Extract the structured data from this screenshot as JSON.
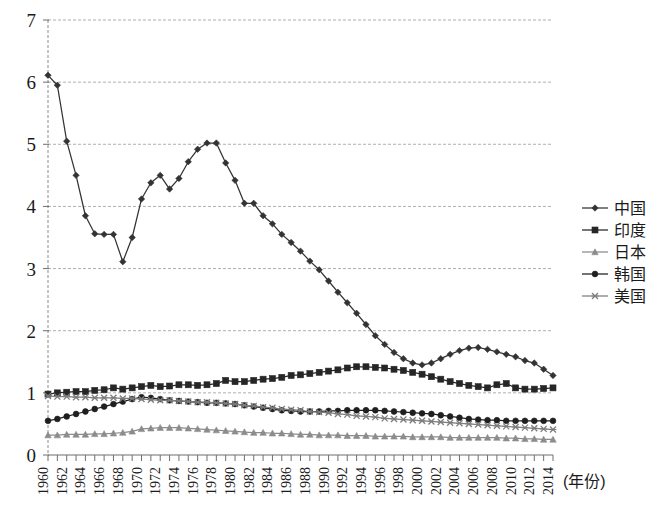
{
  "chart_data": {
    "type": "line",
    "title": "",
    "subtitle": "",
    "xlabel": "(年份)",
    "ylabel": "",
    "xlim": [
      1960,
      2014
    ],
    "ylim": [
      0,
      7
    ],
    "ytick_labels": [
      "0",
      "1",
      "2",
      "3",
      "4",
      "5",
      "6",
      "7"
    ],
    "ytick_values": [
      0,
      1,
      2,
      3,
      4,
      5,
      6,
      7
    ],
    "grid": "horizontal-dashed",
    "legend_position": "right",
    "x": [
      1960,
      1961,
      1962,
      1963,
      1964,
      1965,
      1966,
      1967,
      1968,
      1969,
      1970,
      1971,
      1972,
      1973,
      1974,
      1975,
      1976,
      1977,
      1978,
      1979,
      1980,
      1981,
      1982,
      1983,
      1984,
      1985,
      1986,
      1987,
      1988,
      1989,
      1990,
      1991,
      1992,
      1993,
      1994,
      1995,
      1996,
      1997,
      1998,
      1999,
      2000,
      2001,
      2002,
      2003,
      2004,
      2005,
      2006,
      2007,
      2008,
      2009,
      2010,
      2011,
      2012,
      2013,
      2014
    ],
    "xtick_labels": [
      "1960",
      "1962",
      "1964",
      "1966",
      "1968",
      "1970",
      "1972",
      "1974",
      "1976",
      "1978",
      "1980",
      "1982",
      "1984",
      "1986",
      "1988",
      "1990",
      "1992",
      "1994",
      "1996",
      "1998",
      "2000",
      "2002",
      "2004",
      "2006",
      "2008",
      "2010",
      "2012",
      "2014"
    ],
    "series": [
      {
        "name": "中国",
        "marker": "diamond",
        "color": "#333333",
        "values": [
          6.11,
          5.95,
          5.05,
          4.5,
          3.85,
          3.56,
          3.55,
          3.55,
          3.11,
          3.5,
          4.12,
          4.38,
          4.5,
          4.28,
          4.45,
          4.72,
          4.92,
          5.02,
          5.02,
          4.7,
          4.42,
          4.05,
          4.05,
          3.85,
          3.72,
          3.55,
          3.42,
          3.28,
          3.12,
          2.98,
          2.8,
          2.62,
          2.45,
          2.28,
          2.1,
          1.92,
          1.78,
          1.65,
          1.55,
          1.48,
          1.45,
          1.48,
          1.55,
          1.62,
          1.68,
          1.72,
          1.73,
          1.7,
          1.66,
          1.62,
          1.58,
          1.52,
          1.48,
          1.38,
          1.28
        ]
      },
      {
        "name": "印度",
        "marker": "square",
        "color": "#262626",
        "values": [
          0.98,
          1.0,
          1.01,
          1.02,
          1.02,
          1.04,
          1.05,
          1.08,
          1.06,
          1.08,
          1.1,
          1.12,
          1.1,
          1.11,
          1.13,
          1.13,
          1.12,
          1.13,
          1.15,
          1.2,
          1.18,
          1.18,
          1.2,
          1.22,
          1.23,
          1.25,
          1.28,
          1.29,
          1.31,
          1.33,
          1.35,
          1.37,
          1.4,
          1.42,
          1.42,
          1.41,
          1.4,
          1.38,
          1.36,
          1.33,
          1.3,
          1.26,
          1.22,
          1.18,
          1.15,
          1.12,
          1.1,
          1.08,
          1.13,
          1.15,
          1.08,
          1.06,
          1.06,
          1.07,
          1.08
        ]
      },
      {
        "name": "日本",
        "marker": "triangle",
        "color": "#8c8c8c",
        "values": [
          0.32,
          0.32,
          0.33,
          0.33,
          0.33,
          0.34,
          0.34,
          0.35,
          0.36,
          0.38,
          0.42,
          0.43,
          0.44,
          0.44,
          0.44,
          0.43,
          0.42,
          0.41,
          0.4,
          0.39,
          0.38,
          0.37,
          0.36,
          0.36,
          0.35,
          0.35,
          0.34,
          0.33,
          0.33,
          0.32,
          0.32,
          0.32,
          0.31,
          0.31,
          0.31,
          0.3,
          0.3,
          0.3,
          0.3,
          0.29,
          0.29,
          0.29,
          0.29,
          0.28,
          0.28,
          0.28,
          0.28,
          0.28,
          0.28,
          0.27,
          0.27,
          0.26,
          0.26,
          0.25,
          0.25
        ]
      },
      {
        "name": "韩国",
        "marker": "circle",
        "color": "#1f1f1f",
        "values": [
          0.55,
          0.58,
          0.62,
          0.66,
          0.7,
          0.74,
          0.78,
          0.82,
          0.86,
          0.9,
          0.93,
          0.92,
          0.9,
          0.88,
          0.87,
          0.86,
          0.85,
          0.84,
          0.84,
          0.83,
          0.82,
          0.8,
          0.78,
          0.76,
          0.74,
          0.72,
          0.71,
          0.7,
          0.7,
          0.7,
          0.71,
          0.71,
          0.72,
          0.72,
          0.72,
          0.72,
          0.71,
          0.7,
          0.69,
          0.68,
          0.67,
          0.66,
          0.64,
          0.62,
          0.6,
          0.58,
          0.57,
          0.56,
          0.56,
          0.55,
          0.55,
          0.55,
          0.55,
          0.55,
          0.55
        ]
      },
      {
        "name": "美国",
        "marker": "x",
        "color": "#7d7d7d",
        "values": [
          0.95,
          0.94,
          0.94,
          0.93,
          0.93,
          0.92,
          0.92,
          0.92,
          0.91,
          0.91,
          0.9,
          0.89,
          0.88,
          0.88,
          0.87,
          0.86,
          0.85,
          0.85,
          0.84,
          0.83,
          0.82,
          0.8,
          0.79,
          0.77,
          0.76,
          0.74,
          0.73,
          0.72,
          0.7,
          0.69,
          0.68,
          0.66,
          0.65,
          0.63,
          0.62,
          0.61,
          0.59,
          0.58,
          0.57,
          0.56,
          0.55,
          0.54,
          0.53,
          0.52,
          0.51,
          0.5,
          0.49,
          0.48,
          0.47,
          0.46,
          0.45,
          0.44,
          0.43,
          0.42,
          0.41
        ]
      }
    ]
  },
  "legend": {
    "items": [
      {
        "label": "中国"
      },
      {
        "label": "印度"
      },
      {
        "label": "日本"
      },
      {
        "label": "韩国"
      },
      {
        "label": "美国"
      }
    ]
  },
  "axes": {
    "x_axis_title": "(年份)"
  }
}
